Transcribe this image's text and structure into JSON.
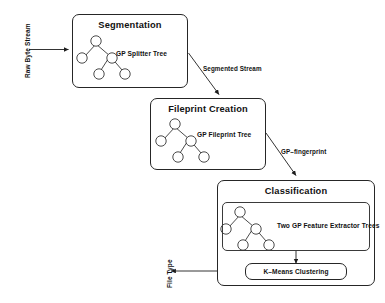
{
  "diagram": {
    "type": "flowchart",
    "stages": [
      {
        "id": "segmentation",
        "title": "Segmentation",
        "tree_label": "GP Splitter Tree",
        "has_inner_box": false
      },
      {
        "id": "fileprint-creation",
        "title": "Fileprint Creation",
        "tree_label": "GP Fileprint Tree",
        "has_inner_box": false
      },
      {
        "id": "classification",
        "title": "Classification",
        "tree_label": "Two GP Feature Extractor Trees",
        "has_inner_box": true,
        "sub_block_label": "K–Means Clustering"
      }
    ],
    "edges": [
      {
        "id": "input-edge",
        "label": "Raw Byte Stream",
        "orientation": "vertical",
        "direction": "right"
      },
      {
        "id": "segmented-edge",
        "label": "Segmented Stream",
        "orientation": "diagonal",
        "direction": "down-right"
      },
      {
        "id": "fingerprint-edge",
        "label": "GP–fingerprint",
        "orientation": "diagonal",
        "direction": "down-right"
      },
      {
        "id": "output-edge",
        "label": "File Type",
        "orientation": "vertical",
        "direction": "left"
      },
      {
        "id": "kmeans-edge",
        "label": "",
        "orientation": "vertical",
        "direction": "down"
      }
    ],
    "colors": {
      "stroke": "#262626",
      "text": "#111111",
      "background": "#ffffff",
      "node_fill": "#ffffff"
    }
  }
}
